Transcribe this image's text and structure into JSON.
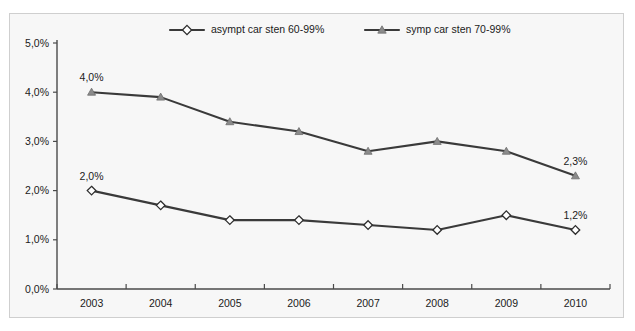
{
  "chart_data": {
    "type": "line",
    "title": "",
    "xlabel": "",
    "ylabel": "",
    "categories": [
      "2003",
      "2004",
      "2005",
      "2006",
      "2007",
      "2008",
      "2009",
      "2010"
    ],
    "ylim": [
      0,
      5
    ],
    "y_ticks": [
      "0,0%",
      "1,0%",
      "2,0%",
      "3,0%",
      "4,0%",
      "5,0%"
    ],
    "y_tick_values": [
      0,
      1,
      2,
      3,
      4,
      5
    ],
    "grid": false,
    "legend_position": "top-center",
    "series": [
      {
        "name": "asympt car sten 60-99%",
        "marker": "diamond-open",
        "values": [
          2.0,
          1.7,
          1.4,
          1.4,
          1.3,
          1.2,
          1.5,
          1.2
        ],
        "point_labels": [
          {
            "index": 0,
            "text": "2,0%"
          },
          {
            "index": 7,
            "text": "1,2%"
          }
        ]
      },
      {
        "name": "symp car sten 70-99%",
        "marker": "triangle-filled",
        "values": [
          4.0,
          3.9,
          3.4,
          3.2,
          2.8,
          3.0,
          2.8,
          2.3
        ],
        "point_labels": [
          {
            "index": 0,
            "text": "4,0%"
          },
          {
            "index": 7,
            "text": "2,3%"
          }
        ]
      }
    ],
    "colors": {
      "line": "#3a3a3a",
      "marker_open_fill": "#ffffff",
      "marker_filled": "#8b8b8b",
      "axis": "#4a4a4a",
      "panel_background": "#f7f7f7",
      "panel_border": "#cfcfcf",
      "text": "#1b1b1b"
    }
  },
  "legend": {
    "entries": [
      {
        "label": "asympt car sten 60-99%",
        "marker": "diamond-open"
      },
      {
        "label": "symp car sten 70-99%",
        "marker": "triangle-filled"
      }
    ]
  }
}
